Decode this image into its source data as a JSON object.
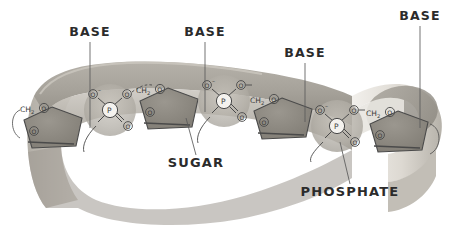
{
  "diagram": {
    "type": "nucleic-acid-backbone",
    "title_text_present": false,
    "background_color": "#ffffff",
    "ribbon": {
      "name": "twisted-ribbon-backbone",
      "description": "curved 3D ribbon band sweeping left to right then folding back at the right end",
      "fill_light": "#d8d4cd",
      "fill_mid": "#b9b5ad",
      "fill_dark": "#9b978f",
      "fill_shadow": "#8a867e",
      "edge_color": "#c9c5bd"
    },
    "labels": [
      {
        "id": "base-1",
        "text": "BASE",
        "x": 90,
        "y": 36
      },
      {
        "id": "base-2",
        "text": "BASE",
        "x": 205,
        "y": 36
      },
      {
        "id": "base-3",
        "text": "BASE",
        "x": 305,
        "y": 57
      },
      {
        "id": "base-4",
        "text": "BASE",
        "x": 420,
        "y": 20
      },
      {
        "id": "sugar",
        "text": "SUGAR",
        "x": 196,
        "y": 163
      },
      {
        "id": "phosphate",
        "text": "PHOSPHATE",
        "x": 350,
        "y": 192
      }
    ],
    "sugars": [
      {
        "id": "sugar-1",
        "cx": 52,
        "cy": 127,
        "ch2_label": "CH",
        "ch2_sub": "2",
        "o_ring_label": "O",
        "o_apex_label": "O",
        "fill": "#8e8a82"
      },
      {
        "id": "sugar-2",
        "cx": 168,
        "cy": 108,
        "ch2_label": "CH",
        "ch2_sub": "2",
        "o_ring_label": "O",
        "o_apex_label": "O",
        "fill": "#8e8a82"
      },
      {
        "id": "sugar-3",
        "cx": 282,
        "cy": 118,
        "ch2_label": "CH",
        "ch2_sub": "2",
        "o_ring_label": "O",
        "o_apex_label": "O",
        "fill": "#8e8a82"
      },
      {
        "id": "sugar-4",
        "cx": 398,
        "cy": 131,
        "ch2_label": "CH",
        "ch2_sub": "2",
        "o_ring_label": "O",
        "o_apex_label": "O",
        "fill": "#8e8a82"
      }
    ],
    "phosphates": [
      {
        "id": "phosphate-1",
        "cx": 110,
        "cy": 110,
        "p_label": "P",
        "o_minus_label": "O",
        "o_minus_charge": "–",
        "o_ester_label": "O",
        "o_double_label": "O",
        "ch2_label": "CH",
        "ch2_sub": "2",
        "halo_fill": "#b0aca4"
      },
      {
        "id": "phosphate-2",
        "cx": 224,
        "cy": 101,
        "p_label": "P",
        "o_minus_label": "O",
        "o_minus_charge": "–",
        "o_ester_label": "O",
        "o_double_label": "O",
        "ch2_label": "CH",
        "ch2_sub": "2",
        "halo_fill": "#b0aca4"
      },
      {
        "id": "phosphate-3",
        "cx": 337,
        "cy": 126,
        "p_label": "P",
        "o_minus_label": "O",
        "o_minus_charge": "–",
        "o_ester_label": "O",
        "o_double_label": "O",
        "ch2_label": "CH",
        "ch2_sub": "2",
        "halo_fill": "#a9a59d"
      }
    ],
    "leader_lines": [
      {
        "id": "leader-base-1",
        "x1": 90,
        "y1": 42,
        "x2": 90,
        "y2": 128
      },
      {
        "id": "leader-base-2",
        "x1": 205,
        "y1": 42,
        "x2": 205,
        "y2": 112
      },
      {
        "id": "leader-base-3",
        "x1": 305,
        "y1": 63,
        "x2": 305,
        "y2": 122
      },
      {
        "id": "leader-base-4",
        "x1": 420,
        "y1": 26,
        "x2": 420,
        "y2": 128
      },
      {
        "id": "leader-sugar",
        "x1": 196,
        "y1": 155,
        "x2": 186,
        "y2": 118
      },
      {
        "id": "leader-phosphate",
        "x1": 350,
        "y1": 184,
        "x2": 340,
        "y2": 142
      }
    ],
    "colors": {
      "label_text": "#2b2b2b",
      "chem_text": "#3a3a3a",
      "bond_line": "#4a4a4a",
      "leader_line": "#5a5a5a"
    }
  }
}
